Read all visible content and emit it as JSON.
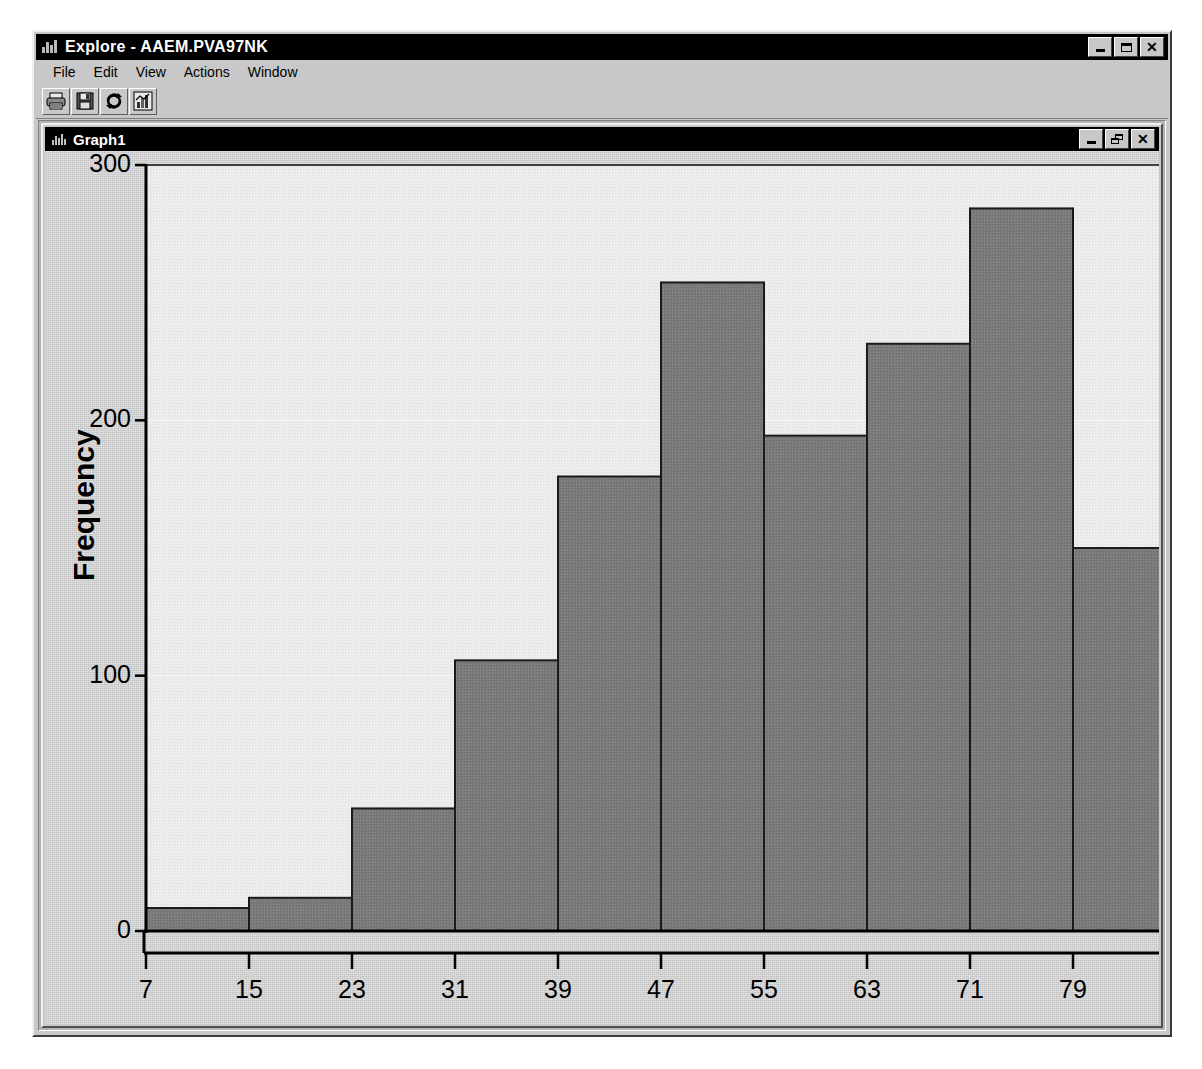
{
  "window": {
    "title": "Explore - AAEM.PVA97NK",
    "icon": "explore-icon",
    "buttons": {
      "minimize": "_",
      "maximize": "□",
      "close": "✕"
    }
  },
  "menubar": {
    "items": [
      {
        "label": "File"
      },
      {
        "label": "Edit"
      },
      {
        "label": "View"
      },
      {
        "label": "Actions"
      },
      {
        "label": "Window"
      }
    ]
  },
  "toolbar": {
    "buttons": [
      {
        "name": "print-icon",
        "tooltip": "Print"
      },
      {
        "name": "save-icon",
        "tooltip": "Save"
      },
      {
        "name": "refresh-icon",
        "tooltip": "Refresh"
      },
      {
        "name": "chart-icon",
        "tooltip": "Graph"
      }
    ]
  },
  "graph_window": {
    "title": "Graph1",
    "icon": "histogram-icon",
    "buttons": {
      "minimize": "_",
      "restore": "❐",
      "close": "✕"
    }
  },
  "colors": {
    "desktop": "#b4b4b4",
    "face": "#c8c8c8",
    "titlebar": "#000000",
    "titlebar_text": "#ffffff",
    "plot_background": "#c4c4c4",
    "plot_inner": "#ebebeb",
    "bar_fill": "#7a7a7a",
    "bar_stroke": "#1a1a1a",
    "gridline": "#f4f4f4",
    "axis": "#000000"
  },
  "chart_data": {
    "type": "bar",
    "title": "",
    "xlabel": "Age",
    "ylabel": "Frequency",
    "bin_width": 8,
    "bin_edges": [
      7,
      15,
      23,
      31,
      39,
      47,
      55,
      63,
      71,
      79,
      87
    ],
    "categories": [
      "7-15",
      "15-23",
      "23-31",
      "31-39",
      "39-47",
      "47-55",
      "55-63",
      "63-71",
      "71-79",
      "79-87"
    ],
    "values": [
      9,
      13,
      48,
      106,
      178,
      254,
      194,
      230,
      283,
      150
    ],
    "xtick_labels": [
      "7",
      "15",
      "23",
      "31",
      "39",
      "47",
      "55",
      "63",
      "71",
      "79",
      "87"
    ],
    "ytick_labels": [
      "0",
      "100",
      "200",
      "300"
    ],
    "yticks": [
      0,
      100,
      200,
      300
    ],
    "xlim": [
      7,
      87
    ],
    "ylim": [
      0,
      300
    ],
    "grid": true,
    "legend": false
  }
}
